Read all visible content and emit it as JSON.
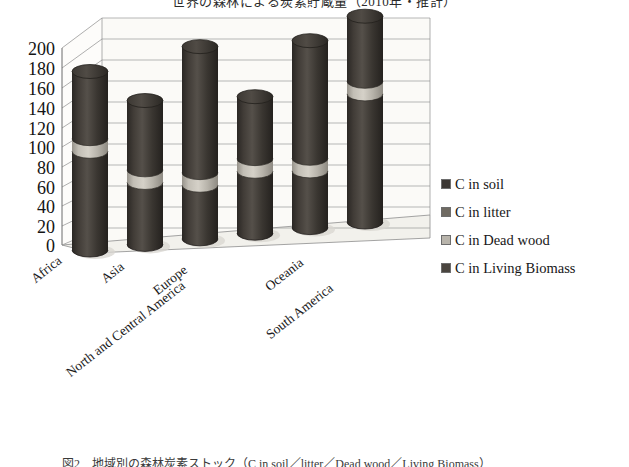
{
  "figure": {
    "title": "世界の森林による炭素貯蔵量（2010年・推計）",
    "caption": "図2　地域別の森林炭素ストック（C in soil／litter／Dead wood／Living Biomass）"
  },
  "chart_data": {
    "type": "bar",
    "subtype": "stacked-cylinder-3d",
    "title": "世界の森林による炭素貯蔵量（2010年・推計）",
    "xlabel": "",
    "ylabel": "",
    "ylim": [
      0,
      200
    ],
    "yticks": [
      0,
      20,
      40,
      60,
      80,
      100,
      120,
      140,
      160,
      180,
      200
    ],
    "grid": true,
    "legend_position": "right",
    "categories": [
      "Africa",
      "Asia",
      "Europe",
      "North and Central America",
      "Oceania",
      "South America"
    ],
    "series": [
      {
        "name": "C in Living Biomass",
        "values": [
          95,
          57,
          48,
          57,
          52,
          118
        ]
      },
      {
        "name": "C in Dead wood",
        "values": [
          10,
          9,
          10,
          9,
          9,
          12
        ]
      },
      {
        "name": "C in litter",
        "values": [
          5,
          4,
          5,
          4,
          5,
          5
        ]
      },
      {
        "name": "C in soil",
        "values": [
          60,
          67,
          120,
          60,
          112,
          61
        ]
      }
    ],
    "totals": [
      170,
      137,
      183,
      130,
      178,
      196
    ],
    "band_positions": [
      100,
      65,
      57,
      65,
      60,
      128
    ]
  },
  "axis": {
    "ytick_labels": [
      "200",
      "180",
      "160",
      "140",
      "120",
      "100",
      "80",
      "60",
      "40",
      "20",
      "0"
    ]
  },
  "legend": {
    "items": [
      {
        "label": "C in soil",
        "color": "#3b3733"
      },
      {
        "label": "C in litter",
        "color": "#6f6a62"
      },
      {
        "label": "C in Dead wood",
        "color": "#b8b4ab"
      },
      {
        "label": "C in Living Biomass",
        "color": "#4a453f"
      }
    ]
  },
  "colors": {
    "bar_dark": "#332f2b",
    "bar_mid": "#4a453f",
    "bar_light": "#b9b4aa",
    "grid": "#8d8d8d",
    "axis": "#6b6b6b",
    "floor": "#f4f3ef",
    "wall": "#fbfaf7",
    "text": "#141414"
  }
}
